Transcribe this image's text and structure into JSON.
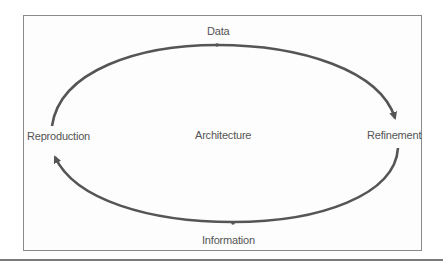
{
  "diagram": {
    "type": "cycle",
    "center_label": "Architecture",
    "nodes": [
      {
        "id": "data",
        "label": "Data",
        "position": "top"
      },
      {
        "id": "refinement",
        "label": "Refinement",
        "position": "right"
      },
      {
        "id": "information",
        "label": "Information",
        "position": "bottom"
      },
      {
        "id": "reproduction",
        "label": "Reproduction",
        "position": "left"
      }
    ],
    "edges": [
      {
        "from": "reproduction",
        "to": "refinement",
        "via": "data",
        "direction": "clockwise"
      },
      {
        "from": "refinement",
        "to": "reproduction",
        "via": "information",
        "direction": "clockwise"
      }
    ],
    "colors": {
      "arrow": "#555555",
      "text": "#555555",
      "frame": "#8a8a8a"
    }
  }
}
